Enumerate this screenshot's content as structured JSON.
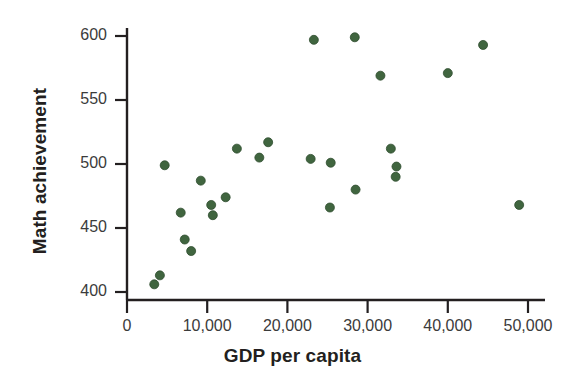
{
  "chart_data": {
    "type": "scatter",
    "title": "",
    "subtitle": "",
    "xlabel": "GDP per capita",
    "ylabel": "Math achievement",
    "xlim": [
      0,
      52000
    ],
    "ylim": [
      395,
      608
    ],
    "grid": false,
    "legend": null,
    "marker_color": "#40653f",
    "marker_edge_color": "#2f4d2e",
    "marker_size_px": 9,
    "axis_color": "#231f20",
    "xticks": [
      0,
      10000,
      20000,
      30000,
      40000,
      50000
    ],
    "xtick_labels": [
      "0",
      "10,000",
      "20,000",
      "30,000",
      "40,000",
      "50,000"
    ],
    "yticks": [
      400,
      450,
      500,
      550,
      600
    ],
    "ytick_labels": [
      "400",
      "450",
      "500",
      "550",
      "600"
    ],
    "points": [
      {
        "x": 3400,
        "y": 406
      },
      {
        "x": 4100,
        "y": 413
      },
      {
        "x": 4700,
        "y": 499
      },
      {
        "x": 6700,
        "y": 462
      },
      {
        "x": 7200,
        "y": 441
      },
      {
        "x": 8000,
        "y": 432
      },
      {
        "x": 9200,
        "y": 487
      },
      {
        "x": 10500,
        "y": 468
      },
      {
        "x": 10700,
        "y": 460
      },
      {
        "x": 12300,
        "y": 474
      },
      {
        "x": 13700,
        "y": 512
      },
      {
        "x": 16500,
        "y": 505
      },
      {
        "x": 17600,
        "y": 517
      },
      {
        "x": 22900,
        "y": 504
      },
      {
        "x": 23300,
        "y": 597
      },
      {
        "x": 25300,
        "y": 466
      },
      {
        "x": 25400,
        "y": 501
      },
      {
        "x": 28400,
        "y": 599
      },
      {
        "x": 28500,
        "y": 480
      },
      {
        "x": 31600,
        "y": 569
      },
      {
        "x": 32900,
        "y": 512
      },
      {
        "x": 33600,
        "y": 498
      },
      {
        "x": 33500,
        "y": 490
      },
      {
        "x": 40000,
        "y": 571
      },
      {
        "x": 44400,
        "y": 593
      },
      {
        "x": 48900,
        "y": 468
      }
    ]
  },
  "axes": {
    "x_title": "GDP per capita",
    "y_title": "Math achievement"
  }
}
